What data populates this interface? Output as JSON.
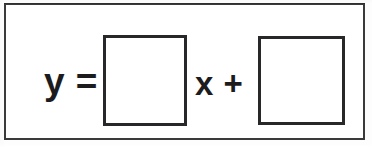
{
  "worksheet": {
    "frame": {
      "border_color": "#3a3a3c",
      "background_color": "#ffffff"
    },
    "equation": {
      "lhs_label": "y =",
      "operator_label": "x +",
      "fields": [
        {
          "name": "slope",
          "value": "",
          "placeholder": "",
          "border_color": "#28282a"
        },
        {
          "name": "y-intercept",
          "value": "",
          "placeholder": "",
          "border_color": "#28282a"
        }
      ]
    }
  }
}
